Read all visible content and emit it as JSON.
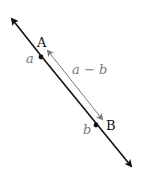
{
  "diagram": {
    "points": [
      {
        "label": "A",
        "value_label": "a"
      },
      {
        "label": "B",
        "value_label": "b"
      }
    ],
    "difference_label": "a − b",
    "colors": {
      "line": "#111111",
      "difference_arrow": "#7a7a7a",
      "value_text": "#777777"
    }
  }
}
